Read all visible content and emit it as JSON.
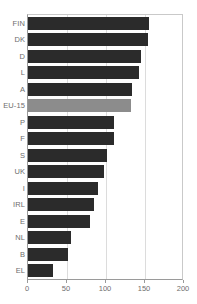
{
  "chart_data": {
    "type": "bar",
    "orientation": "horizontal",
    "title": "",
    "subtitle": "",
    "xlabel": "",
    "ylabel": "",
    "xlim": [
      0,
      200
    ],
    "xticks": [
      0,
      50,
      100,
      150,
      200
    ],
    "xtick_labels": [
      "0",
      "50",
      "100",
      "150",
      "200"
    ],
    "grid": "vertical",
    "legend": "none",
    "categories": [
      "FIN",
      "DK",
      "D",
      "L",
      "A",
      "EU-15",
      "P",
      "F",
      "S",
      "UK",
      "I",
      "IRL",
      "E",
      "NL",
      "B",
      "EL"
    ],
    "values": [
      155,
      154,
      145,
      142,
      133,
      132,
      110,
      110,
      101,
      97,
      90,
      85,
      79,
      55,
      51,
      32
    ],
    "highlight_category": "EU-15",
    "bars": [
      {
        "label": "FIN",
        "value": 155,
        "highlight": false
      },
      {
        "label": "DK",
        "value": 154,
        "highlight": false
      },
      {
        "label": "D",
        "value": 145,
        "highlight": false
      },
      {
        "label": "L",
        "value": 142,
        "highlight": false
      },
      {
        "label": "A",
        "value": 133,
        "highlight": false
      },
      {
        "label": "EU-15",
        "value": 132,
        "highlight": true
      },
      {
        "label": "P",
        "value": 110,
        "highlight": false
      },
      {
        "label": "F",
        "value": 110,
        "highlight": false
      },
      {
        "label": "S",
        "value": 101,
        "highlight": false
      },
      {
        "label": "UK",
        "value": 97,
        "highlight": false
      },
      {
        "label": "I",
        "value": 90,
        "highlight": false
      },
      {
        "label": "IRL",
        "value": 85,
        "highlight": false
      },
      {
        "label": "E",
        "value": 79,
        "highlight": false
      },
      {
        "label": "NL",
        "value": 55,
        "highlight": false
      },
      {
        "label": "B",
        "value": 51,
        "highlight": false
      },
      {
        "label": "EL",
        "value": 32,
        "highlight": false
      }
    ]
  },
  "colors": {
    "bar": "#2b2b2b",
    "bar_highlight": "#8c8c8c",
    "gridline": "#dcdcdc",
    "axis": "#9a9a9a",
    "frame": "#c9c9c9",
    "text": "#6e6e6e",
    "background": "#ffffff"
  }
}
